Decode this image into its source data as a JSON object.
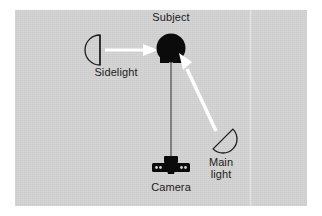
{
  "figure": {
    "background_color": "#ffffff",
    "panel_color": "#d2d2d2",
    "ink_color": "#1c1c1c",
    "beam_color": "#ffffff"
  },
  "labels": {
    "subject": "Subject",
    "sidelight": "Sidelight",
    "camera": "Camera",
    "main_light": "Main\nlight"
  },
  "elements": {
    "subject_icon": "subject-head-silhouette",
    "camera_icon": "camera-top-view-silhouette",
    "sidelight_icon": "lamp-reflector-d-shape",
    "mainlight_icon": "lamp-reflector-d-shape",
    "sidelight_beam": "white-arrow-right",
    "mainlight_beam": "white-arrow-up-left",
    "camera_axis": "camera-to-subject-sight-line",
    "fold_line": "page-fold-vertical-line"
  },
  "diagram_data": {
    "type": "diagram",
    "nodes": [
      {
        "id": "subject",
        "label": "Subject",
        "x": 171,
        "y": 49,
        "shape": "filled-circle"
      },
      {
        "id": "camera",
        "label": "Camera",
        "x": 171,
        "y": 170,
        "shape": "filled-camera"
      },
      {
        "id": "sidelight",
        "label": "Sidelight",
        "x": 88,
        "y": 50,
        "shape": "outline-d",
        "aim": "right"
      },
      {
        "id": "main_light",
        "label": "Main light",
        "x": 223,
        "y": 139,
        "shape": "outline-d",
        "aim": "up-left"
      }
    ],
    "edges": [
      {
        "from": "sidelight",
        "to": "subject",
        "style": "white-arrow"
      },
      {
        "from": "main_light",
        "to": "subject",
        "style": "white-arrow"
      },
      {
        "from": "camera",
        "to": "subject",
        "style": "thin-line"
      }
    ]
  }
}
